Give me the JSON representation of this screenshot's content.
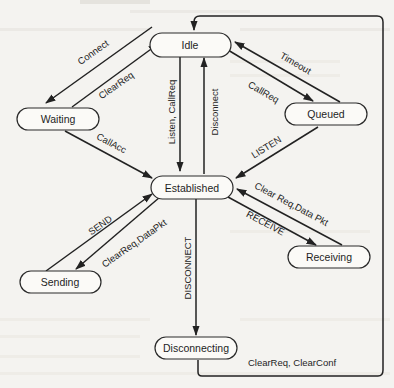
{
  "diagram": {
    "type": "state-transition",
    "colors": {
      "background": "#f4f3f0",
      "node_fill": "#fbfaf7",
      "stroke": "#222222",
      "text": "#1e1e1e"
    },
    "nodes": {
      "idle": "Idle",
      "waiting": "Waiting",
      "queued": "Queued",
      "established": "Established",
      "sending": "Sending",
      "receiving": "Receiving",
      "disconnecting": "Disconnecting"
    },
    "edges": {
      "connect": {
        "label": "Connect",
        "from": "Idle",
        "to": "Waiting"
      },
      "clearreq_waiting": {
        "label": "ClearReq",
        "from": "Waiting",
        "to": "Idle"
      },
      "listen_callreq": {
        "label": "Listen, CallReq",
        "from": "Idle",
        "to": "Established"
      },
      "disconnect": {
        "label": "Disconnect",
        "from": "Established",
        "to": "Idle"
      },
      "callreq_queued": {
        "label": "CallReq",
        "from": "Idle",
        "to": "Queued"
      },
      "timeout": {
        "label": "Timeout",
        "from": "Queued",
        "to": "Idle"
      },
      "callacc": {
        "label": "CallAcc",
        "from": "Waiting",
        "to": "Established"
      },
      "listen_upper": {
        "label": "LISTEN",
        "from": "Queued",
        "to": "Established"
      },
      "send": {
        "label": "SEND",
        "from": "Sending",
        "to": "Established"
      },
      "clearreq_datapkt_send": {
        "label": "ClearReq,DataPkt",
        "from": "Established",
        "to": "Sending"
      },
      "clearreq_datapkt_recv": {
        "label": "Clear Req,Data Pkt",
        "from": "Receiving",
        "to": "Established"
      },
      "receive": {
        "label": "RECEIVE",
        "from": "Established",
        "to": "Receiving"
      },
      "disconnect_upper": {
        "label": "DISCONNECT",
        "from": "Established",
        "to": "Disconnecting"
      },
      "clearreq_clearconf": {
        "label": "ClearReq, ClearConf",
        "from": "Disconnecting",
        "to": "Idle"
      }
    }
  }
}
